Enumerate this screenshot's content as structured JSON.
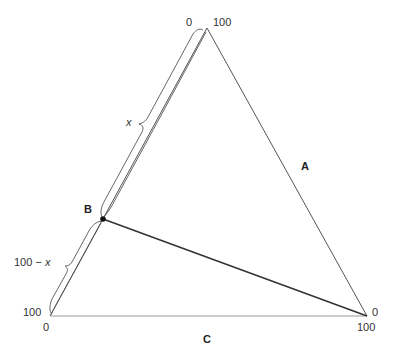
{
  "diagram": {
    "type": "ternary-diagram",
    "vertices": {
      "top": {
        "x": 207,
        "y": 28
      },
      "bottom_left": {
        "x": 50,
        "y": 316
      },
      "bottom_right": {
        "x": 367,
        "y": 316
      }
    },
    "point_B": {
      "x": 103,
      "y": 219
    },
    "side_labels": {
      "A": "A",
      "B": "B",
      "C": "C"
    },
    "tick_labels": {
      "top_left": "0",
      "top_right": "100",
      "left_bottom": "100",
      "bottom_left": "0",
      "right_top": "0",
      "right_bottom": "100"
    },
    "bracket_labels": {
      "upper": "x",
      "lower_prefix": "100 − ",
      "lower_var": "x"
    },
    "colors": {
      "triangle": "#555555",
      "tie_line": "#333333",
      "bracket": "#555555",
      "text": "#333333"
    }
  }
}
